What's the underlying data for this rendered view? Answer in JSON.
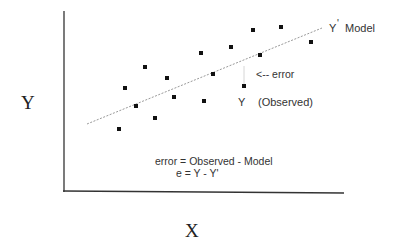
{
  "axes": {
    "x_label": "X",
    "y_label": "Y"
  },
  "labels": {
    "model_line": "Y",
    "model_prime": "'",
    "model_word": "Model",
    "error_arrow": "<-- error",
    "observed_y": "Y",
    "observed_word": "(Observed)",
    "formula_line1": "error = Observed - Model",
    "formula_line2": "e = Y - Y'"
  },
  "colors": {
    "axis": "#333333",
    "points": "#111111",
    "model_line": "#999999",
    "text": "#333333"
  },
  "points": [
    {
      "x": 119,
      "y": 129
    },
    {
      "x": 125,
      "y": 88
    },
    {
      "x": 136,
      "y": 106
    },
    {
      "x": 145,
      "y": 67
    },
    {
      "x": 155,
      "y": 118
    },
    {
      "x": 167,
      "y": 78
    },
    {
      "x": 174,
      "y": 97
    },
    {
      "x": 201,
      "y": 53
    },
    {
      "x": 204,
      "y": 101
    },
    {
      "x": 213,
      "y": 74
    },
    {
      "x": 231,
      "y": 47
    },
    {
      "x": 244,
      "y": 86
    },
    {
      "x": 253,
      "y": 30
    },
    {
      "x": 260,
      "y": 55
    },
    {
      "x": 281,
      "y": 27
    },
    {
      "x": 311,
      "y": 42
    }
  ]
}
